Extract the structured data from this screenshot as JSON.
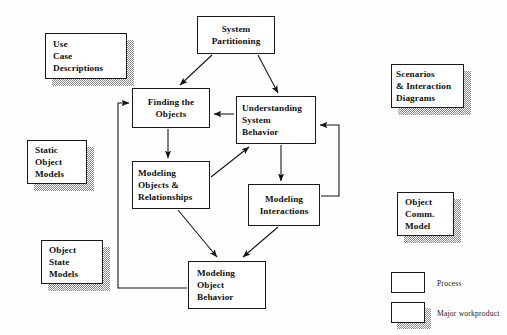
{
  "diagram": {
    "processes": [
      {
        "id": "system-partitioning",
        "lines": [
          "System",
          "Partitioning"
        ],
        "x": 197,
        "y": 16,
        "w": 78,
        "h": 38
      },
      {
        "id": "finding-the-objects",
        "lines": [
          "Finding the",
          "Objects"
        ],
        "x": 132,
        "y": 88,
        "w": 78,
        "h": 40
      },
      {
        "id": "understanding-system-behavior",
        "lines": [
          "Understanding",
          "System",
          "Behavior"
        ],
        "x": 236,
        "y": 96,
        "w": 80,
        "h": 48
      },
      {
        "id": "modeling-objects-relationships",
        "lines": [
          "Modeling",
          "Objects &",
          "Relationships"
        ],
        "x": 132,
        "y": 161,
        "w": 78,
        "h": 48
      },
      {
        "id": "modeling-interactions",
        "lines": [
          "Modeling",
          "Interactions"
        ],
        "x": 248,
        "y": 184,
        "w": 72,
        "h": 42
      },
      {
        "id": "modeling-object-behavior",
        "lines": [
          "Modeling",
          "Object",
          "Behavior"
        ],
        "x": 188,
        "y": 261,
        "w": 78,
        "h": 48
      }
    ],
    "workproducts": [
      {
        "id": "use-case-descriptions",
        "lines": [
          "Use",
          "Case",
          "Descriptions"
        ],
        "x": 45,
        "y": 33,
        "w": 82,
        "h": 46
      },
      {
        "id": "static-object-models",
        "lines": [
          "Static",
          "Object",
          "Models"
        ],
        "x": 27,
        "y": 140,
        "w": 60,
        "h": 44
      },
      {
        "id": "object-state-models",
        "lines": [
          "Object",
          "State",
          "Models"
        ],
        "x": 41,
        "y": 240,
        "w": 62,
        "h": 44
      },
      {
        "id": "scenarios-interaction-diagrams",
        "lines": [
          "Scenarios",
          "& Interaction",
          "Diagrams"
        ],
        "x": 391,
        "y": 64,
        "w": 73,
        "h": 44
      },
      {
        "id": "object-comm-model",
        "lines": [
          "Object",
          "Comm.",
          "Model"
        ],
        "x": 397,
        "y": 192,
        "w": 57,
        "h": 44
      }
    ],
    "legend": {
      "process_label": "Process",
      "workproduct_label": "Major workproduct",
      "process_swatch": {
        "x": 391,
        "y": 272,
        "w": 34,
        "h": 21
      },
      "process_text": {
        "x": 437,
        "y": 279
      },
      "workproduct_swatch": {
        "x": 391,
        "y": 302,
        "w": 34,
        "h": 21
      },
      "workproduct_text": {
        "x": 437,
        "y": 309
      }
    },
    "edges": [
      {
        "id": "partitioning-to-finding",
        "from": "system-partitioning",
        "to": "finding-the-objects",
        "kind": "arrow"
      },
      {
        "id": "partitioning-to-understanding",
        "from": "system-partitioning",
        "to": "understanding-system-behavior",
        "kind": "arrow"
      },
      {
        "id": "understanding-to-finding",
        "from": "understanding-system-behavior",
        "to": "finding-the-objects",
        "kind": "arrow"
      },
      {
        "id": "finding-to-modeling-objects",
        "from": "finding-the-objects",
        "to": "modeling-objects-relationships",
        "kind": "arrow"
      },
      {
        "id": "modeling-objects-to-understanding",
        "from": "modeling-objects-relationships",
        "to": "understanding-system-behavior",
        "kind": "arrow"
      },
      {
        "id": "understanding-to-modeling-interactions",
        "from": "understanding-system-behavior",
        "to": "modeling-interactions",
        "kind": "arrow"
      },
      {
        "id": "modeling-interactions-to-understanding",
        "from": "modeling-interactions",
        "to": "understanding-system-behavior",
        "kind": "feedback-arrow"
      },
      {
        "id": "modeling-objects-to-object-behavior",
        "from": "modeling-objects-relationships",
        "to": "modeling-object-behavior",
        "kind": "arrow"
      },
      {
        "id": "modeling-interactions-to-object-behavior",
        "from": "modeling-interactions",
        "to": "modeling-object-behavior",
        "kind": "arrow"
      },
      {
        "id": "object-behavior-to-finding",
        "from": "modeling-object-behavior",
        "to": "finding-the-objects",
        "kind": "feedback-arrow"
      }
    ]
  }
}
